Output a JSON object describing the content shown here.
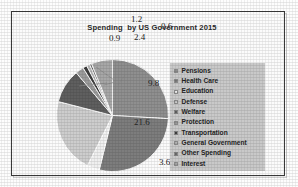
{
  "chart_data": {
    "type": "pie",
    "title": "Spending  by US Government 2015",
    "xlabel": "",
    "ylabel": "",
    "legend_position": "right",
    "grid": false,
    "categories": [
      "Pensions",
      "Health Care",
      "Education",
      "Defense",
      "Welfare",
      "Protection",
      "Transportation",
      "General Government",
      "Other Spending",
      "Interest"
    ],
    "values": [
      25.9,
      27.9,
      3.6,
      21.6,
      9.8,
      2.4,
      1.2,
      0.9,
      0.6,
      6.1
    ],
    "labels": [
      "25.9",
      "27.9",
      "3.6",
      "21.6",
      "9.8",
      "2.4",
      "1.2",
      "0.9",
      "0.6",
      "6.1"
    ],
    "slice_colors": [
      "#8f8f8f",
      "#7d7d7d",
      "#efefef",
      "#cdcdcd",
      "#5f5f5f",
      "#9b9b9b",
      "#3f3f3f",
      "#b5b5b5",
      "#6b6b6b",
      "#a7a7a7"
    ]
  },
  "legend": {
    "items": [
      {
        "label": "Pensions",
        "color": "#8f8f8f"
      },
      {
        "label": "Health Care",
        "color": "#7d7d7d"
      },
      {
        "label": "Education",
        "color": "#efefef"
      },
      {
        "label": "Defense",
        "color": "#cdcdcd"
      },
      {
        "label": "Welfare",
        "color": "#5f5f5f"
      },
      {
        "label": "Protection",
        "color": "#9b9b9b"
      },
      {
        "label": "Transportation",
        "color": "#3f3f3f"
      },
      {
        "label": "General Government",
        "color": "#b5b5b5"
      },
      {
        "label": "Other Spending",
        "color": "#6b6b6b"
      },
      {
        "label": "Interest",
        "color": "#a7a7a7"
      }
    ]
  },
  "data_labels": {
    "inside": [
      {
        "text": "25.9",
        "x": 207,
        "y": 83
      },
      {
        "text": "27.9",
        "x": 206,
        "y": 128
      },
      {
        "text": "21.6",
        "x": 143,
        "y": 122
      },
      {
        "text": "9.8",
        "x": 157,
        "y": 83
      },
      {
        "text": "6.1",
        "x": 187,
        "y": 69
      }
    ],
    "outside": [
      {
        "text": "3.6",
        "x": 168,
        "y": 162
      },
      {
        "text": "1.2",
        "x": 140,
        "y": 19
      },
      {
        "text": "0.6",
        "x": 170,
        "y": 26
      },
      {
        "text": "0.9",
        "x": 118,
        "y": 38
      },
      {
        "text": "2.4",
        "x": 143,
        "y": 37
      }
    ]
  }
}
